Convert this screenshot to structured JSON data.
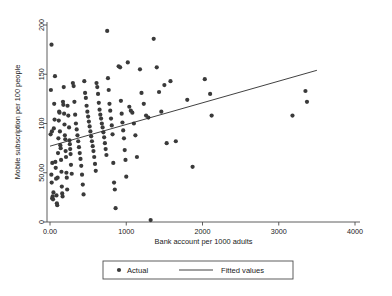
{
  "chart_data": {
    "type": "scatter",
    "title": "",
    "xlabel": "Bank account per 1000 adults",
    "ylabel": "Mobile subscription per 100 people",
    "xlim": [
      -130,
      4180
    ],
    "ylim": [
      -9,
      207
    ],
    "grid": false,
    "xticks": [
      0,
      1000,
      2000,
      3000,
      4000
    ],
    "xtick_labels": [
      "0.00",
      "1000",
      "2000",
      "3000",
      "4000"
    ],
    "yticks": [
      0,
      50,
      100,
      150,
      200
    ],
    "ytick_labels": [
      "0",
      "50.00",
      "100",
      "150",
      "200"
    ],
    "legend_position": "below-center",
    "series": [
      {
        "name": "Actual",
        "type": "scatter",
        "marker": "circle",
        "color": "#3a3a3a",
        "points": [
          [
            20,
            180
          ],
          [
            12,
            134
          ],
          [
            8,
            89
          ],
          [
            25,
            92
          ],
          [
            30,
            60
          ],
          [
            18,
            48
          ],
          [
            22,
            40
          ],
          [
            35,
            26
          ],
          [
            28,
            24
          ],
          [
            40,
            23
          ],
          [
            45,
            30
          ],
          [
            50,
            95
          ],
          [
            55,
            120
          ],
          [
            60,
            104
          ],
          [
            65,
            148
          ],
          [
            70,
            61
          ],
          [
            75,
            55
          ],
          [
            80,
            44
          ],
          [
            85,
            27
          ],
          [
            90,
            19
          ],
          [
            95,
            17
          ],
          [
            100,
            45
          ],
          [
            105,
            70
          ],
          [
            110,
            85
          ],
          [
            115,
            103
          ],
          [
            120,
            112
          ],
          [
            125,
            111
          ],
          [
            130,
            92
          ],
          [
            135,
            78
          ],
          [
            140,
            75
          ],
          [
            145,
            63
          ],
          [
            150,
            51
          ],
          [
            155,
            36
          ],
          [
            160,
            29
          ],
          [
            165,
            26
          ],
          [
            170,
            122
          ],
          [
            175,
            119
          ],
          [
            180,
            137
          ],
          [
            185,
            110
          ],
          [
            190,
            99
          ],
          [
            195,
            88
          ],
          [
            200,
            84
          ],
          [
            205,
            72
          ],
          [
            210,
            66
          ],
          [
            215,
            50
          ],
          [
            220,
            45
          ],
          [
            225,
            33
          ],
          [
            230,
            118
          ],
          [
            240,
            108
          ],
          [
            250,
            96
          ],
          [
            255,
            83
          ],
          [
            260,
            79
          ],
          [
            265,
            74
          ],
          [
            270,
            69
          ],
          [
            275,
            58
          ],
          [
            285,
            49
          ],
          [
            300,
            141
          ],
          [
            310,
            138
          ],
          [
            320,
            122
          ],
          [
            330,
            109
          ],
          [
            340,
            100
          ],
          [
            350,
            94
          ],
          [
            360,
            88
          ],
          [
            370,
            82
          ],
          [
            380,
            76
          ],
          [
            390,
            70
          ],
          [
            400,
            64
          ],
          [
            410,
            57
          ],
          [
            420,
            48
          ],
          [
            430,
            38
          ],
          [
            440,
            28
          ],
          [
            450,
            143
          ],
          [
            460,
            131
          ],
          [
            470,
            126
          ],
          [
            480,
            118
          ],
          [
            490,
            112
          ],
          [
            500,
            107
          ],
          [
            510,
            102
          ],
          [
            520,
            97
          ],
          [
            530,
            92
          ],
          [
            540,
            87
          ],
          [
            550,
            82
          ],
          [
            560,
            77
          ],
          [
            570,
            72
          ],
          [
            580,
            66
          ],
          [
            590,
            59
          ],
          [
            600,
            52
          ],
          [
            610,
            141
          ],
          [
            620,
            137
          ],
          [
            630,
            130
          ],
          [
            640,
            121
          ],
          [
            650,
            114
          ],
          [
            660,
            109
          ],
          [
            670,
            105
          ],
          [
            680,
            100
          ],
          [
            690,
            96
          ],
          [
            700,
            91
          ],
          [
            710,
            86
          ],
          [
            720,
            80
          ],
          [
            730,
            74
          ],
          [
            740,
            68
          ],
          [
            750,
            194
          ],
          [
            760,
            146
          ],
          [
            770,
            134
          ],
          [
            780,
            120
          ],
          [
            790,
            113
          ],
          [
            800,
            105
          ],
          [
            810,
            98
          ],
          [
            820,
            89
          ],
          [
            830,
            60
          ],
          [
            840,
            40
          ],
          [
            850,
            33
          ],
          [
            860,
            14
          ],
          [
            900,
            158
          ],
          [
            920,
            157
          ],
          [
            930,
            123
          ],
          [
            940,
            110
          ],
          [
            950,
            101
          ],
          [
            960,
            93
          ],
          [
            970,
            85
          ],
          [
            980,
            73
          ],
          [
            990,
            63
          ],
          [
            1000,
            46
          ],
          [
            1020,
            162
          ],
          [
            1040,
            117
          ],
          [
            1060,
            113
          ],
          [
            1080,
            111
          ],
          [
            1100,
            100
          ],
          [
            1120,
            88
          ],
          [
            1140,
            66
          ],
          [
            1180,
            155
          ],
          [
            1200,
            131
          ],
          [
            1230,
            120
          ],
          [
            1260,
            108
          ],
          [
            1290,
            106
          ],
          [
            1320,
            2
          ],
          [
            1360,
            186
          ],
          [
            1400,
            157
          ],
          [
            1430,
            132
          ],
          [
            1460,
            112
          ],
          [
            1500,
            139
          ],
          [
            1530,
            80
          ],
          [
            1580,
            143
          ],
          [
            1650,
            82
          ],
          [
            1800,
            124
          ],
          [
            1870,
            56
          ],
          [
            2030,
            145
          ],
          [
            2100,
            130
          ],
          [
            2120,
            108
          ],
          [
            3180,
            108
          ],
          [
            3350,
            133
          ],
          [
            3370,
            122
          ]
        ]
      },
      {
        "name": "Fitted values",
        "type": "line",
        "color": "#2b2b2b",
        "endpoints": [
          [
            0,
            77
          ],
          [
            3500,
            154
          ]
        ]
      }
    ]
  },
  "legend": {
    "actual_label": "Actual",
    "fitted_label": "Fitted values",
    "marker_icon": "dot-icon",
    "line_icon": "line-icon"
  }
}
